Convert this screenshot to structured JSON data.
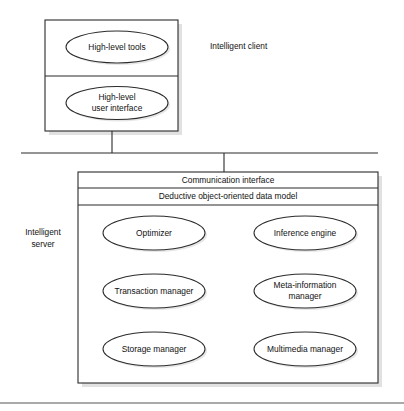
{
  "diagram": {
    "stroke_color": "#2b2b2b",
    "fill_color": "#ffffff",
    "shadow_color": "#c9c9c9",
    "background": "#ffffff"
  },
  "client": {
    "side_label": "Intelligent client",
    "nodes": [
      {
        "label": "High-level tools",
        "lines": [
          "High-level tools"
        ]
      },
      {
        "label": "High-level user interface",
        "lines": [
          "High-level",
          "user interface"
        ]
      }
    ]
  },
  "server": {
    "side_label_lines": [
      "Intelligent",
      "server"
    ],
    "bands": [
      {
        "label": "Communication interface"
      },
      {
        "label": "Deductive object-oriented data model"
      }
    ],
    "nodes": [
      {
        "label": "Optimizer",
        "lines": [
          "Optimizer"
        ],
        "column": "left",
        "row": 1
      },
      {
        "label": "Inference engine",
        "lines": [
          "Inference engine"
        ],
        "column": "right",
        "row": 1
      },
      {
        "label": "Transaction manager",
        "lines": [
          "Transaction manager"
        ],
        "column": "left",
        "row": 2
      },
      {
        "label": "Meta-information manager",
        "lines": [
          "Meta-information",
          "manager"
        ],
        "column": "right",
        "row": 2
      },
      {
        "label": "Storage manager",
        "lines": [
          "Storage manager"
        ],
        "column": "left",
        "row": 3
      },
      {
        "label": "Multimedia manager",
        "lines": [
          "Multimedia manager"
        ],
        "column": "right",
        "row": 3
      }
    ]
  }
}
